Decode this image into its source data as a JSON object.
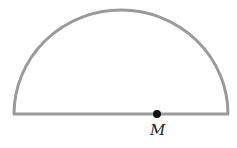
{
  "diagram": {
    "shape": "semicircle",
    "stroke_color": "#9a9a9a",
    "point_color": "#111111",
    "points": [
      {
        "label": "M",
        "position": "on diameter, right of center"
      }
    ]
  }
}
